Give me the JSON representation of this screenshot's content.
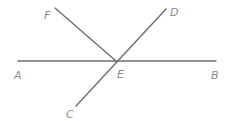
{
  "diagram": {
    "type": "geometry-intersecting-lines",
    "points": {
      "A": {
        "label": "A"
      },
      "B": {
        "label": "B"
      },
      "C": {
        "label": "C"
      },
      "D": {
        "label": "D"
      },
      "E": {
        "label": "E"
      },
      "F": {
        "label": "F"
      }
    },
    "segments": [
      {
        "name": "AB",
        "from": "A",
        "to": "B"
      },
      {
        "name": "CD",
        "from": "C",
        "to": "D"
      },
      {
        "name": "FE",
        "from": "F",
        "to": "E"
      }
    ],
    "intersection": "E",
    "colors": {
      "line": "#6e6e6e",
      "label": "#8a8a8a",
      "background": "#ffffff"
    }
  }
}
